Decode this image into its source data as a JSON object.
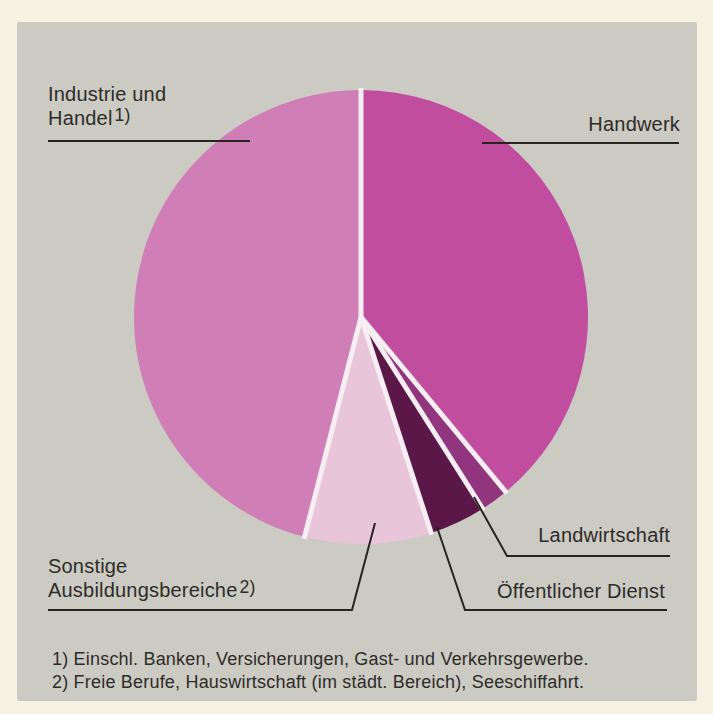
{
  "chart_data": {
    "type": "pie",
    "title": "",
    "start_angle_deg": 0,
    "direction": "clockwise",
    "values_unit": "percent",
    "slices": [
      {
        "label": "Handwerk",
        "value": 39,
        "color": "#c14d9f"
      },
      {
        "label": "Landwirtschaft",
        "value": 2,
        "color": "#90357e"
      },
      {
        "label": "Öffentlicher Dienst",
        "value": 4,
        "color": "#5a1747"
      },
      {
        "label": "Sonstige Ausbildungsbereiche 2)",
        "value": 9,
        "color": "#e9c5d9"
      },
      {
        "label": "Industrie und Handel 1)",
        "value": 46,
        "color": "#d07fb6"
      }
    ],
    "legend_position": "callout-labels-with-leader-lines"
  },
  "callouts": {
    "industrie": {
      "line1": "Industrie und",
      "line2": "Handel",
      "sup": "1)"
    },
    "handwerk": "Handwerk",
    "landwirtschaft": "Landwirtschaft",
    "oeffentlicher_dienst": "Öffentlicher Dienst",
    "sonstige": {
      "line1": "Sonstige",
      "line2": "Ausbildungsbereiche",
      "sup": "2)"
    }
  },
  "footnotes": [
    "1) Einschl. Banken, Versicherungen, Gast- und Verkehrsgewerbe.",
    "2) Freie Berufe, Hauswirtschaft (im städt. Bereich), Seeschiffahrt."
  ],
  "colors": {
    "page_margin": "#f6f2e3",
    "panel_background": "#cbcac3",
    "text": "#2e2c29",
    "leader_line": "#26241f",
    "slice_gap": "#f6eef2"
  }
}
